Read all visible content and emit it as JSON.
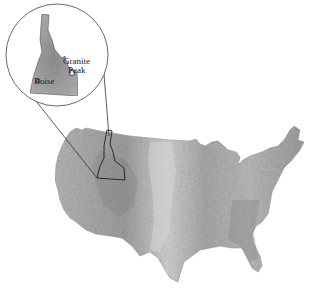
{
  "map": {
    "subject": "Contiguous United States shaded relief map",
    "highlight_state": "Idaho",
    "inset": {
      "shape": "circle",
      "labels": {
        "peak_line1": "Granite",
        "peak_line2": "Peak",
        "city": "Boise"
      },
      "markers": [
        {
          "name": "Granite Peak",
          "symbol": "triangle"
        },
        {
          "name": "Boise",
          "symbol": "circle"
        }
      ]
    },
    "colors": {
      "background": "#ffffff",
      "land_light": "#c8c8c8",
      "land_mid": "#a8a8a8",
      "land_dark": "#8a8a8a",
      "outline": "#333333"
    }
  }
}
